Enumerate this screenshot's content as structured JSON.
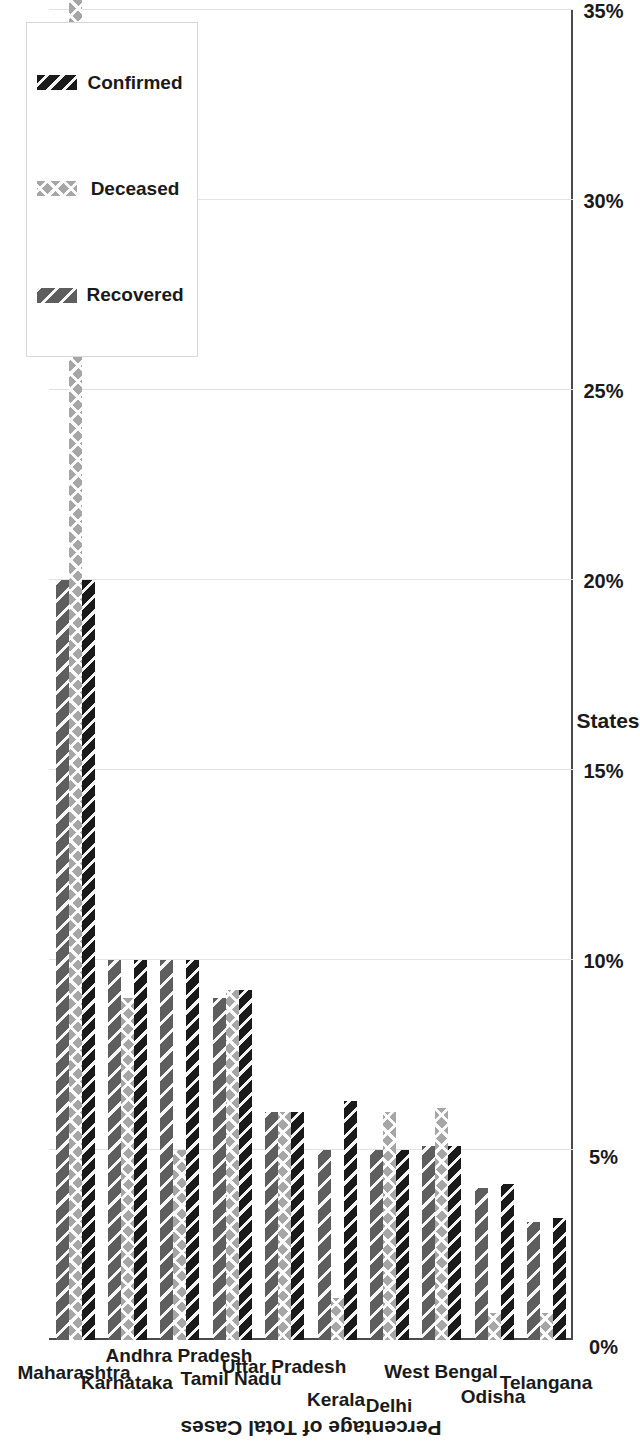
{
  "chart_data": {
    "type": "bar",
    "orientation": "vertical",
    "title": "",
    "xlabel": "States",
    "ylabel": "Percentage of Total Cases",
    "ylim": [
      0,
      35
    ],
    "ytick_labels": [
      "0%",
      "5%",
      "10%",
      "15%",
      "20%",
      "25%",
      "30%",
      "35%"
    ],
    "ytick_values": [
      0,
      5,
      10,
      15,
      20,
      25,
      30,
      35
    ],
    "grid": true,
    "legend_position": "top-right",
    "categories": [
      "Maharashtra",
      "Karnataka",
      "Andhra Pradesh",
      "Tamil Nadu",
      "Uttar Pradesh",
      "Kerala",
      "Delhi",
      "West Bengal",
      "Odisha",
      "Telangana"
    ],
    "series": [
      {
        "name": "Confirmed",
        "color": "#1a1a1a",
        "pattern": "diagonal-hatch",
        "values": [
          20.0,
          10.0,
          10.0,
          9.2,
          6.0,
          6.3,
          5.0,
          5.1,
          4.1,
          3.2
        ]
      },
      {
        "name": "Deceased",
        "color": "#a6a6a6",
        "pattern": "cross-hatch",
        "values": [
          35.7,
          9.0,
          5.0,
          9.2,
          6.0,
          1.1,
          6.0,
          6.1,
          0.7,
          0.7
        ]
      },
      {
        "name": "Recovered",
        "color": "#5e5e5e",
        "pattern": "diagonal-hatch-wide",
        "values": [
          20.0,
          10.0,
          10.0,
          9.0,
          6.0,
          5.0,
          5.0,
          5.1,
          4.0,
          3.1
        ]
      }
    ]
  },
  "legend": {
    "items": [
      {
        "label": "Confirmed",
        "swatch": "confirmed-swatch"
      },
      {
        "label": "Deceased",
        "swatch": "deceased-swatch"
      },
      {
        "label": "Recovered",
        "swatch": "recovered-swatch"
      }
    ]
  },
  "axes": {
    "value_axis_title": "Percentage of Total Cases",
    "category_axis_title": "States"
  }
}
